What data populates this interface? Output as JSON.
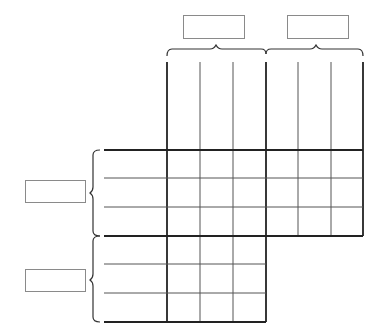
{
  "diagram": {
    "type": "logic-grid-puzzle",
    "column_categories": [
      {
        "label": "",
        "item_count": 3
      },
      {
        "label": "",
        "item_count": 3
      }
    ],
    "row_categories": [
      {
        "label": "",
        "item_count": 3
      },
      {
        "label": "",
        "item_count": 3
      }
    ],
    "column_item_labels": [
      "",
      "",
      "",
      "",
      "",
      ""
    ],
    "row_item_labels": [
      "",
      "",
      "",
      "",
      "",
      ""
    ],
    "colors": {
      "line": "#222222",
      "thin_line": "#555555",
      "box_border": "#8a8a8a",
      "background": "#ffffff"
    }
  }
}
